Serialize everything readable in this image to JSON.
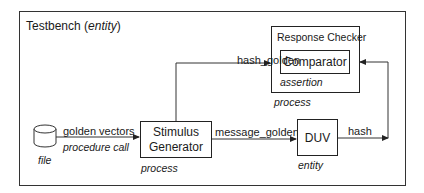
{
  "testbench": {
    "title": "Testbench",
    "title_kind": "entity"
  },
  "response_checker": {
    "title": "Response Checker",
    "kind": "process"
  },
  "comparator": {
    "title": "Comparator",
    "kind": "assertion"
  },
  "stimulus_generator": {
    "line1": "Stimulus",
    "line2": "Generator",
    "kind": "process"
  },
  "duv": {
    "title": "DUV",
    "kind": "entity"
  },
  "file": {
    "kind": "file"
  },
  "signals": {
    "golden_vectors": "golden vectors",
    "procedure_call": "procedure call",
    "hash_golden": "hash_golden",
    "message_golden": "message_golden",
    "hash": "hash"
  },
  "paren_open": "(",
  "paren_close": ")"
}
